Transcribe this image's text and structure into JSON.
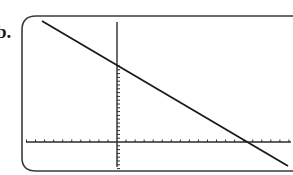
{
  "problem_label": "b.",
  "colors": {
    "line": "#1a1a1a",
    "axis": "#2a2a2a",
    "frame": "#3a3a3a",
    "background": "#ffffff"
  },
  "chart_data": {
    "type": "line",
    "title": "",
    "xlabel": "",
    "ylabel": "",
    "grid": false,
    "legend": null,
    "axes": {
      "x_ticks_negative": 10,
      "x_ticks_positive": 19,
      "y_ticks_positive": 20,
      "y_ticks_negative": 7,
      "tick_labels": []
    },
    "series": [
      {
        "name": "line",
        "description": "negative slope line",
        "y_intercept_ticks": 20,
        "x_intercept_ticks": 14.5,
        "points_pixel": [
          [
            42,
            21
          ],
          [
            117,
            66
          ],
          [
            249,
            142
          ],
          [
            288,
            166
          ]
        ]
      }
    ]
  }
}
